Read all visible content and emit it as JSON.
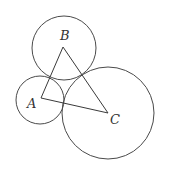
{
  "diagram": {
    "type": "geometry",
    "colors": {
      "stroke": "#4a4a4a",
      "background": "#ffffff",
      "label": "#333333"
    },
    "vertices": [
      {
        "id": "A",
        "label": "A",
        "x": 41,
        "y": 98
      },
      {
        "id": "B",
        "label": "B",
        "x": 63,
        "y": 47
      },
      {
        "id": "C",
        "label": "C",
        "x": 108,
        "y": 113
      }
    ],
    "circles": [
      {
        "center": "A",
        "cx": 40,
        "cy": 100,
        "r": 24
      },
      {
        "center": "B",
        "cx": 64,
        "cy": 48,
        "r": 32
      },
      {
        "center": "C",
        "cx": 108,
        "cy": 113,
        "r": 46
      }
    ],
    "edges": [
      {
        "from": "A",
        "to": "B"
      },
      {
        "from": "B",
        "to": "C"
      },
      {
        "from": "C",
        "to": "A"
      }
    ],
    "labels": {
      "A": "A",
      "B": "B",
      "C": "C"
    }
  }
}
